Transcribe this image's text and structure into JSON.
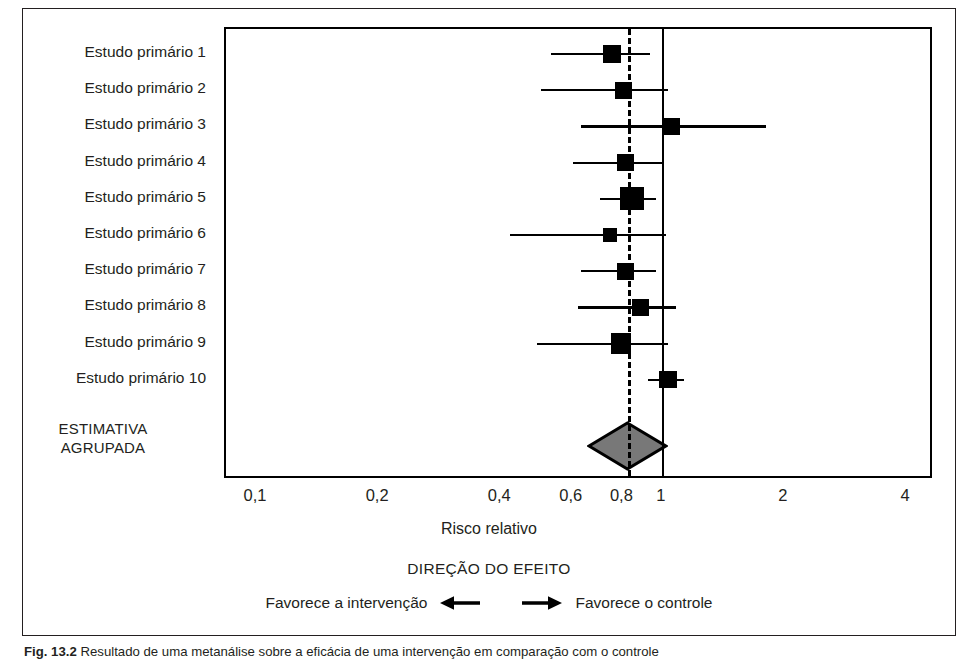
{
  "figure": {
    "caption_id": "Fig. 13.2",
    "caption_text": "Resultado de uma metanálise sobre a eficácia de uma intervenção em comparação com o controle"
  },
  "axis": {
    "title": "Risco relativo",
    "scale": "log",
    "tick_labels": [
      "0,1",
      "0,2",
      "0,4",
      "0,6",
      "0,8",
      "1",
      "2",
      "4"
    ],
    "tick_values": [
      0.1,
      0.2,
      0.4,
      0.6,
      0.8,
      1,
      2,
      4
    ],
    "null_value": 1,
    "range": [
      0.085,
      4.6
    ]
  },
  "direction": {
    "title": "DIREÇÃO DO EFEITO",
    "left_label": "Favorece a intervenção",
    "right_label": "Favorece o controle",
    "left_arrow_icon": "arrow-left-icon",
    "right_arrow_icon": "arrow-right-icon"
  },
  "pooled": {
    "label_line1": "ESTIMATIVA",
    "label_line2": "AGRUPADA",
    "estimate": 0.82,
    "ci_low": 0.73,
    "ci_high": 0.92,
    "diamond_fill": "#787878",
    "diamond_stroke": "#000000"
  },
  "chart_data": {
    "type": "forest",
    "title": "",
    "xlabel": "Risco relativo",
    "ylabel": "",
    "scale": "log",
    "xlim": [
      0.085,
      4.6
    ],
    "null_line": 1,
    "pooled_line": 0.82,
    "grid": false,
    "categories": [
      "Estudo primário 1",
      "Estudo primário 2",
      "Estudo primário 3",
      "Estudo primário 4",
      "Estudo primário 5",
      "Estudo primário 6",
      "Estudo primário 7",
      "Estudo primário 8",
      "Estudo primário 9",
      "Estudo primário 10",
      "ESTIMATIVA AGRUPADA"
    ],
    "studies": [
      {
        "label": "Estudo primário 1",
        "estimate": 0.75,
        "ci_low": 0.53,
        "ci_high": 0.93,
        "weight": 2,
        "marker": "square"
      },
      {
        "label": "Estudo primário 2",
        "estimate": 0.8,
        "ci_low": 0.5,
        "ci_high": 1.03,
        "weight": 2,
        "marker": "square"
      },
      {
        "label": "Estudo primário 3",
        "estimate": 1.05,
        "ci_low": 0.63,
        "ci_high": 1.8,
        "weight": 2,
        "marker": "square"
      },
      {
        "label": "Estudo primário 4",
        "estimate": 0.81,
        "ci_low": 0.6,
        "ci_high": 1.0,
        "weight": 2,
        "marker": "square"
      },
      {
        "label": "Estudo primário 5",
        "estimate": 0.84,
        "ci_low": 0.7,
        "ci_high": 0.96,
        "weight": 4,
        "marker": "square"
      },
      {
        "label": "Estudo primário 6",
        "estimate": 0.74,
        "ci_low": 0.42,
        "ci_high": 1.02,
        "weight": 1,
        "marker": "square"
      },
      {
        "label": "Estudo primário 7",
        "estimate": 0.81,
        "ci_low": 0.63,
        "ci_high": 0.96,
        "weight": 2,
        "marker": "square"
      },
      {
        "label": "Estudo primário 8",
        "estimate": 0.88,
        "ci_low": 0.62,
        "ci_high": 1.08,
        "weight": 2,
        "marker": "square"
      },
      {
        "label": "Estudo primário 9",
        "estimate": 0.79,
        "ci_low": 0.49,
        "ci_high": 1.03,
        "weight": 3,
        "marker": "square"
      },
      {
        "label": "Estudo primário 10",
        "estimate": 1.03,
        "ci_low": 0.92,
        "ci_high": 1.13,
        "weight": 2,
        "marker": "square"
      },
      {
        "label": "ESTIMATIVA AGRUPADA",
        "estimate": 0.82,
        "ci_low": 0.73,
        "ci_high": 0.92,
        "weight": 0,
        "marker": "diamond"
      }
    ],
    "annotations": [
      "DIREÇÃO DO EFEITO",
      "Favorece a intervenção",
      "Favorece o controle"
    ]
  }
}
